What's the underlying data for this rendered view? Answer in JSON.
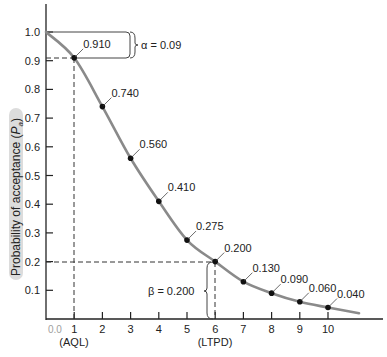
{
  "chart_data": {
    "type": "line",
    "title": "",
    "xlabel": "",
    "ylabel": "Probability of acceptance (Pa)",
    "ylabel_main": "Probability of acceptance (",
    "ylabel_sym": "P",
    "ylabel_sub": "a",
    "ylabel_end": ")",
    "x": [
      1,
      2,
      3,
      4,
      5,
      6,
      7,
      8,
      9,
      10
    ],
    "values": [
      0.91,
      0.74,
      0.56,
      0.41,
      0.275,
      0.2,
      0.13,
      0.09,
      0.06,
      0.04
    ],
    "point_labels": [
      "0.910",
      "0.740",
      "0.560",
      "0.410",
      "0.275",
      "0.200",
      "0.130",
      "0.090",
      "0.060",
      "0.040"
    ],
    "x_ticks": [
      "1",
      "2",
      "3",
      "4",
      "5",
      "6",
      "7",
      "8",
      "9",
      "10"
    ],
    "y_ticks": [
      "0.1",
      "0.2",
      "0.3",
      "0.4",
      "0.5",
      "0.6",
      "0.7",
      "0.8",
      "0.9",
      "1.0"
    ],
    "xlim": [
      0,
      11.5
    ],
    "ylim": [
      0,
      1.1
    ],
    "grid": false,
    "annotations": {
      "aql_label": "(AQL)",
      "ltpd_label": "(LTPD)",
      "alpha_label": "α = 0.09",
      "beta_label": "β = 0.200",
      "origin_scribble": "0.0"
    },
    "colors": {
      "curve": "#8a8a8a",
      "points": "#111111",
      "axis": "#222222",
      "ylabel_highlight": "#d9d9d9"
    }
  }
}
